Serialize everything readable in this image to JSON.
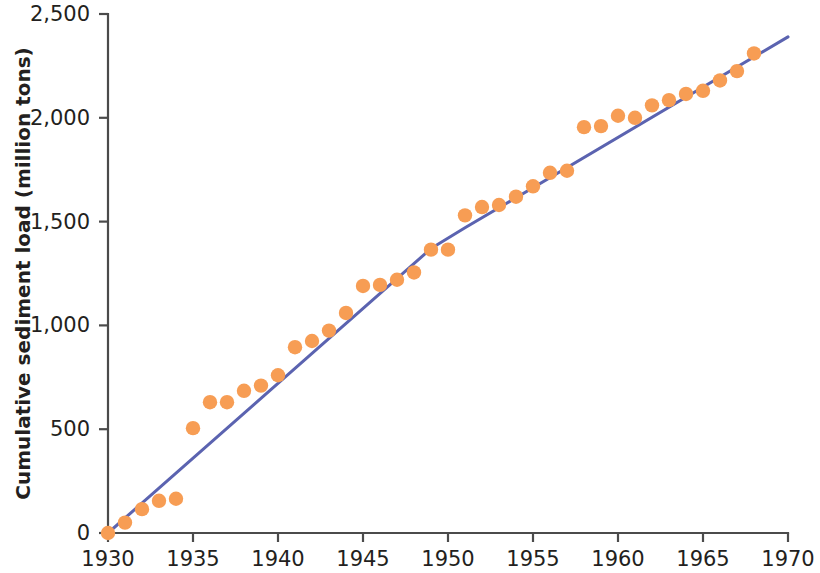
{
  "chart_data": {
    "type": "scatter",
    "title": "",
    "xlabel": "",
    "ylabel": "Cumulative sediment load (million tons)",
    "xlim": [
      1930,
      1970
    ],
    "ylim": [
      0,
      2500
    ],
    "xticks": [
      1930,
      1935,
      1940,
      1945,
      1950,
      1955,
      1960,
      1965,
      1970
    ],
    "xtick_labels": [
      "1930",
      "1935",
      "1940",
      "1945",
      "1950",
      "1955",
      "1960",
      "1965",
      "1970"
    ],
    "yticks": [
      0,
      500,
      1000,
      1500,
      2000,
      2500
    ],
    "ytick_labels": [
      "0",
      "500",
      "1,000",
      "1,500",
      "2,000",
      "2,500"
    ],
    "grid": false,
    "legend": "none",
    "marker_color": "#F79D54",
    "line_color": "#5B63B0",
    "axis_color": "#4b4b4b",
    "text_color": "#231f20",
    "series": [
      {
        "name": "Cumulative sediment load",
        "type": "scatter",
        "marker": "circle",
        "color": "#F79D54",
        "x": [
          1930,
          1931,
          1932,
          1933,
          1934,
          1935,
          1936,
          1937,
          1938,
          1939,
          1940,
          1941,
          1942,
          1943,
          1944,
          1945,
          1946,
          1947,
          1948,
          1949,
          1950,
          1951,
          1952,
          1953,
          1954,
          1955,
          1956,
          1957,
          1958,
          1959,
          1960,
          1961,
          1962,
          1963,
          1964,
          1965,
          1966,
          1967,
          1968
        ],
        "values": [
          0,
          50,
          115,
          155,
          165,
          505,
          630,
          630,
          685,
          710,
          760,
          895,
          925,
          975,
          1060,
          1190,
          1195,
          1220,
          1255,
          1365,
          1365,
          1530,
          1570,
          1580,
          1620,
          1670,
          1735,
          1745,
          1955,
          1960,
          2010,
          2000,
          2060,
          2085,
          2115,
          2130,
          2180,
          2225,
          2310
        ]
      },
      {
        "name": "Fitted trend",
        "type": "line",
        "color": "#5B63B0",
        "x": [
          1930,
          1949,
          1951,
          1970
        ],
        "values": [
          0,
          1370,
          1470,
          2390
        ]
      }
    ]
  }
}
